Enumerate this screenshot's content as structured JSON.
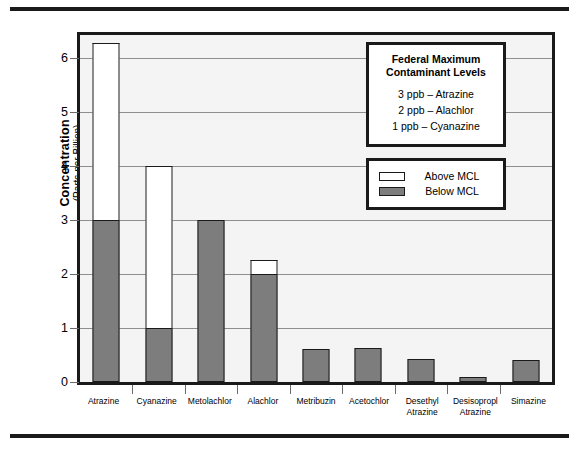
{
  "chart_data": {
    "type": "bar",
    "title": "",
    "xlabel": "",
    "ylabel": "Concentration",
    "ylabel_sub": "(Parts per Billion)",
    "ylim": [
      0,
      6.42
    ],
    "yticks": [
      0,
      1,
      2,
      3,
      4,
      5,
      6
    ],
    "grid": true,
    "stacked": true,
    "categories": [
      "Atrazine",
      "Cyanazine",
      "Metolachlor",
      "Alachlor",
      "Metribuzin",
      "Acetochlor",
      "Desethyl Atrazine",
      "Desisopropl Atrazine",
      "Simazine"
    ],
    "series": [
      {
        "name": "Below MCL",
        "color": "#7d7d7d",
        "values": [
          3.0,
          1.0,
          3.0,
          2.0,
          0.62,
          0.63,
          0.42,
          0.1,
          0.4
        ]
      },
      {
        "name": "Above MCL",
        "color": "#ffffff",
        "values": [
          3.27,
          3.0,
          0,
          0.25,
          0,
          0,
          0,
          0,
          0
        ]
      }
    ],
    "totals": [
      6.27,
      4.0,
      3.0,
      2.25,
      0.62,
      0.63,
      0.42,
      0.1,
      0.4
    ],
    "legend_position": "inside-top-right"
  },
  "y_axis": {
    "title_main": "Concentration",
    "title_sub": "(Parts per Billion)",
    "ticks": [
      "6",
      "5",
      "4",
      "3",
      "2",
      "1",
      "0"
    ]
  },
  "x_axis": {
    "labels": [
      "Atrazine",
      "Cyanazine",
      "Metolachlor",
      "Alachlor",
      "Metribuzin",
      "Acetochlor",
      "Desethyl\nAtrazine",
      "Desisopropl\nAtrazine",
      "Simazine"
    ]
  },
  "mcl_legend": {
    "title": "Federal Maximum\nContaminant Levels",
    "rows": [
      "3 ppb – Atrazine",
      "2 ppb – Alachlor",
      "1 ppb – Cyanazine"
    ]
  },
  "series_legend": {
    "items": [
      {
        "label": "Above MCL",
        "swatch": "above-mcl-swatch"
      },
      {
        "label": "Below MCL",
        "swatch": "below-mcl-swatch"
      }
    ]
  },
  "colors": {
    "below_mcl": "#7d7d7d",
    "above_mcl": "#ffffff",
    "outline": "#1a1a1a",
    "gridline": "#8f8f8f",
    "plot_background": "#f4f4f4"
  }
}
